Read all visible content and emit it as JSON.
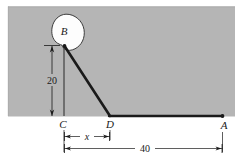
{
  "figure": {
    "background_color": "#ffffff",
    "ground_color": "#b5b5b5",
    "line_color": "#1a1a1a",
    "blob_fill": "#fdfdfd",
    "points": [
      {
        "id": "B",
        "label": "B",
        "x": 64,
        "y": 46
      },
      {
        "id": "C",
        "label": "C",
        "x": 64,
        "y": 116
      },
      {
        "id": "D",
        "label": "D",
        "x": 110,
        "y": 116
      },
      {
        "id": "A",
        "label": "A",
        "x": 222,
        "y": 116
      }
    ],
    "dimensions": [
      {
        "id": "vertical-20",
        "label": "20",
        "orientation": "vertical",
        "from": "B",
        "to": "C",
        "value": 20
      },
      {
        "id": "horizontal-x",
        "label": "x",
        "orientation": "horizontal",
        "from": "C",
        "to": "D",
        "value": "x"
      },
      {
        "id": "horizontal-40",
        "label": "40",
        "orientation": "horizontal",
        "from": "C",
        "to": "A",
        "value": 40
      }
    ],
    "members": [
      {
        "id": "cable-BD",
        "from": "B",
        "to": "D"
      },
      {
        "id": "cable-DA",
        "from": "D",
        "to": "A"
      }
    ],
    "blob": {
      "id": "pulley-body",
      "cx": 68,
      "cy": 33,
      "rx": 16,
      "ry": 19
    }
  }
}
